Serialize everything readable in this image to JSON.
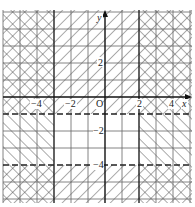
{
  "figure": {
    "type": "coordinate-plane-shaded-regions",
    "origin_label": "O",
    "x_axis_label": "x",
    "y_axis_label": "y",
    "x_tick_labels": [
      "−4",
      "−2",
      "2",
      "4"
    ],
    "y_tick_labels": [
      "2",
      "−2",
      "−4"
    ],
    "grid": {
      "x_min": -6,
      "x_max": 5,
      "y_min": -6,
      "y_max": 5,
      "unit": 1
    },
    "boundaries": [
      {
        "name": "x = -3",
        "style": "solid"
      },
      {
        "name": "x = 2",
        "style": "solid"
      },
      {
        "name": "y = -1",
        "style": "dashed"
      },
      {
        "name": "y = -4",
        "style": "dashed"
      }
    ],
    "regions": [
      {
        "x_range": "x < -3",
        "y_range": "y > -1",
        "hatch": "cross"
      },
      {
        "x_range": "-3 < x < 2",
        "y_range": "y > -1",
        "hatch": "backslash"
      },
      {
        "x_range": "x > 2",
        "y_range": "y > -1",
        "hatch": "cross"
      },
      {
        "x_range": "x < -3",
        "y_range": "-4 < y < -1",
        "hatch": "slash"
      },
      {
        "x_range": "-3 < x < 2",
        "y_range": "-4 < y < -1",
        "hatch": "none"
      },
      {
        "x_range": "x > 2",
        "y_range": "-4 < y < -1",
        "hatch": "slash"
      },
      {
        "x_range": "x < -3",
        "y_range": "y < -4",
        "hatch": "cross"
      },
      {
        "x_range": "-3 < x < 2",
        "y_range": "y < -4",
        "hatch": "backslash"
      },
      {
        "x_range": "x > 2",
        "y_range": "y < -4",
        "hatch": "cross"
      }
    ],
    "colors": {
      "line": "#222222",
      "grid": "#555555",
      "hatch": "#444444",
      "background": "#ffffff"
    }
  }
}
